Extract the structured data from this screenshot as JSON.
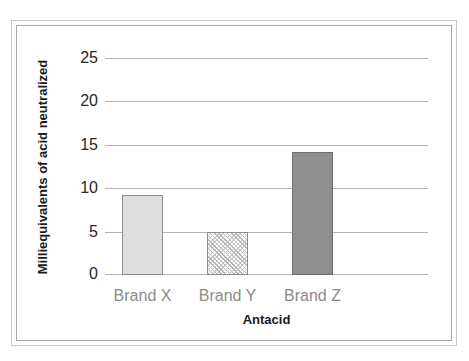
{
  "chart_data": {
    "type": "bar",
    "title": "",
    "subtitle": "",
    "categories": [
      "Brand X",
      "Brand Y",
      "Brand Z"
    ],
    "values": [
      9.3,
      5.0,
      14.2
    ],
    "series": [
      {
        "name": "Milliequivalents of acid neutralized",
        "values": [
          9.3,
          5.0,
          14.2
        ]
      }
    ],
    "xlabel": "Antacid",
    "ylabel": "Milliequivalents of acid neutralized",
    "ylim": [
      0,
      25
    ],
    "yticks": [
      0,
      5,
      10,
      15,
      20,
      25
    ],
    "ytick_labels": [
      "0",
      "5",
      "10",
      "15",
      "20",
      "25"
    ],
    "grid": "horizontal",
    "legend": "none",
    "bar_styles": [
      {
        "category": "Brand X",
        "fill": "solid",
        "color": "#dedede",
        "edge": "#8e8e8e"
      },
      {
        "category": "Brand Y",
        "fill": "hatch-diagonal",
        "color": "#ffffff",
        "edge": "#8e8e8e"
      },
      {
        "category": "Brand Z",
        "fill": "solid",
        "color": "#8f8f8f",
        "edge": "#6e6e6e"
      }
    ],
    "colors": {
      "gridline": "#b4b4b4",
      "tick_label": "#262626",
      "category_label": "#8c8c8c",
      "axis_title": "#1a1a1a",
      "frame_outer": "#c9c9c9",
      "frame_inner": "#a8a8a8",
      "background": "#ffffff"
    }
  }
}
